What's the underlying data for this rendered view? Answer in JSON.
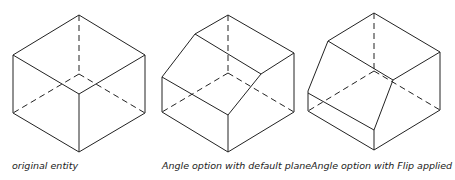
{
  "captions": {
    "fig1": "original entity",
    "fig2": "Angle option with default plane",
    "fig3": "Angle option with Flip applied"
  },
  "colors": {
    "line": "#222222",
    "background": "#ffffff"
  }
}
